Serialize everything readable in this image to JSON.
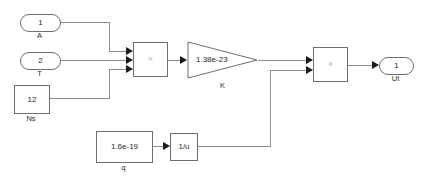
{
  "diagram": {
    "background_color": "#ffffff",
    "wire_color": "#8c8c8c",
    "block_border_color": "#6e6e6e",
    "arrow_color": "#1a1a1a"
  },
  "inports": [
    {
      "number": "1",
      "caption": "A"
    },
    {
      "number": "2",
      "caption": "T"
    }
  ],
  "constants": [
    {
      "value": "12",
      "caption": "Ns"
    },
    {
      "value": "1.6e-19",
      "caption": "q"
    }
  ],
  "products": [
    {
      "symbol": "×",
      "inputs": 3
    },
    {
      "symbol": "×",
      "inputs": 2
    }
  ],
  "gain": {
    "value": "1.38e-23",
    "caption": "K"
  },
  "math_function": {
    "value": "1/u"
  },
  "outports": [
    {
      "number": "1",
      "caption": "Ut"
    }
  ]
}
